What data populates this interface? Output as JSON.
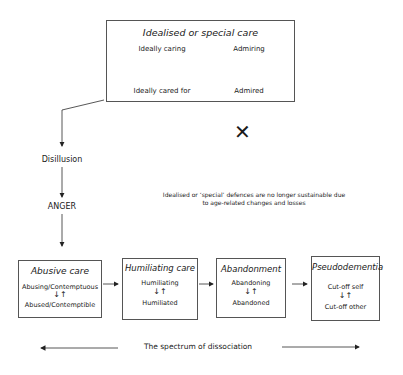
{
  "top_box": {
    "title": "Idealised or special care",
    "pairs": [
      {
        "top": "Ideally caring",
        "bottom": "Ideally cared for"
      },
      {
        "top": "Admiring",
        "bottom": "Admired"
      }
    ]
  },
  "cross_symbol": "✕",
  "flow": {
    "step1": "Disillusion",
    "step2": "ANGER"
  },
  "note": {
    "line1": "Idealised or ‘special’ defences are no longer sustainable due",
    "line2": "to age-related changes and losses"
  },
  "bottom_boxes": [
    {
      "title": "Abusive care",
      "top": "Abusing/Contemptuous",
      "arrows": "↓↑",
      "bottom": "Abused/Contemptible"
    },
    {
      "title": "Humiliating care",
      "top": "Humiliating",
      "arrows": "↓↑",
      "bottom": "Humiliated"
    },
    {
      "title": "Abandonment",
      "top": "Abandoning",
      "arrows": "↓↑",
      "bottom": "Abandoned"
    },
    {
      "title": "Pseudodementia",
      "top": "Cut-off self",
      "arrows": "↓↑",
      "bottom": "Cut-off other"
    }
  ],
  "spectrum_label": "The spectrum of dissociation",
  "colors": {
    "line": "#333333",
    "border": "#555555",
    "text": "#1a1a1a"
  }
}
